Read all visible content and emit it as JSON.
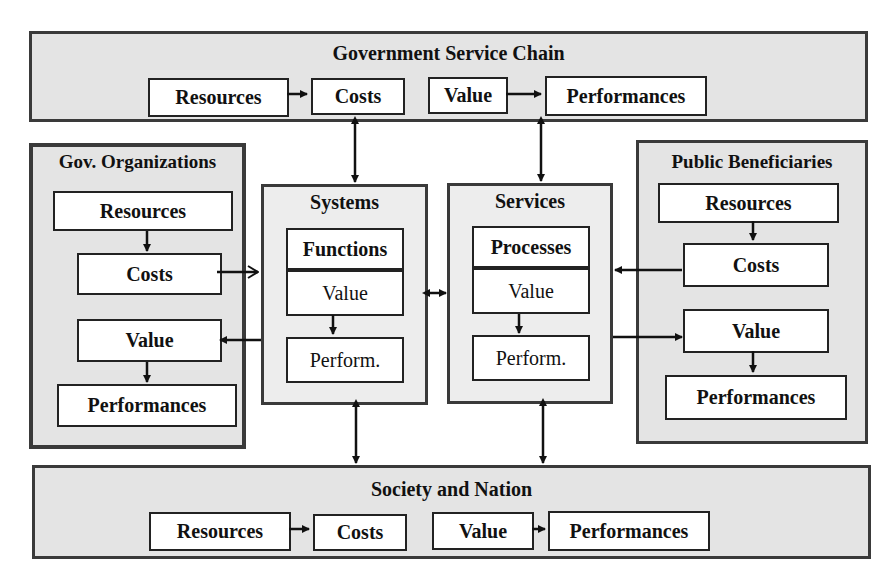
{
  "government_service_chain": {
    "title": "Government Service Chain",
    "flow": [
      "Resources",
      "Costs",
      "Value",
      "Performances"
    ]
  },
  "gov_organizations": {
    "title": "Gov. Organizations",
    "items": [
      "Resources",
      "Costs",
      "Value",
      "Performances"
    ]
  },
  "systems": {
    "title": "Systems",
    "header": "Functions",
    "value": "Value",
    "perform": "Perform."
  },
  "services": {
    "title": "Services",
    "header": "Processes",
    "value": "Value",
    "perform": "Perform."
  },
  "public_beneficiaries": {
    "title": "Public Beneficiaries",
    "items": [
      "Resources",
      "Costs",
      "Value",
      "Performances"
    ]
  },
  "society_and_nation": {
    "title": "Society and Nation",
    "flow": [
      "Resources",
      "Costs",
      "Value",
      "Performances"
    ]
  },
  "colors": {
    "panel_fill": "#e4e4e4",
    "border": "#3a3a3a",
    "box_fill": "#ffffff"
  }
}
